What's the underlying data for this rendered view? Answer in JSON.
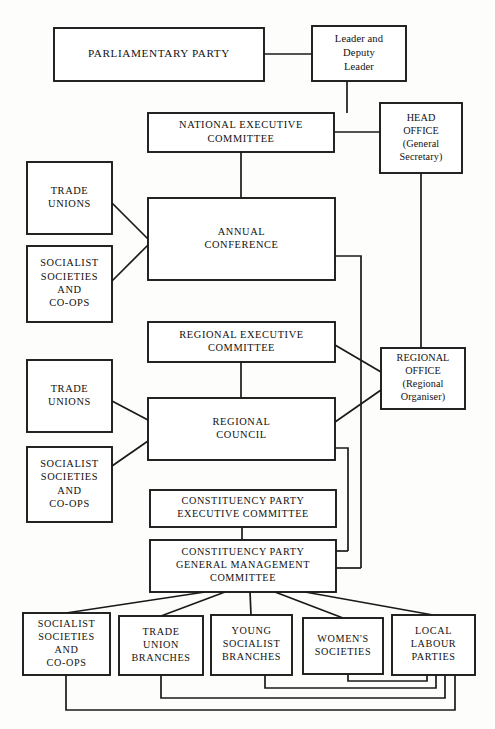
{
  "chart_data": {
    "type": "diagram",
    "orientation": "top-down",
    "nodes": [
      {
        "id": "parliamentary-party",
        "lines": [
          "PARLIAMENTARY PARTY"
        ],
        "style": "caps",
        "x": 54,
        "y": 28,
        "w": 210,
        "h": 53,
        "font": 11.2
      },
      {
        "id": "leader-deputy-leader",
        "lines": [
          "Leader and",
          "Deputy",
          "Leader"
        ],
        "style": "mixed",
        "x": 312,
        "y": 26,
        "w": 94,
        "h": 55,
        "font": 10.6
      },
      {
        "id": "national-executive-committee",
        "lines": [
          "NATIONAL  EXECUTIVE",
          "COMMITTEE"
        ],
        "style": "caps",
        "x": 148,
        "y": 113,
        "w": 186,
        "h": 39,
        "font": 10.4
      },
      {
        "id": "head-office",
        "lines": [
          "HEAD",
          "OFFICE",
          "(General",
          "Secretary)"
        ],
        "style": "mixed",
        "x": 380,
        "y": 103,
        "w": 82,
        "h": 70,
        "font": 10.2
      },
      {
        "id": "trade-unions-national",
        "lines": [
          "TRADE",
          "UNIONS"
        ],
        "style": "caps",
        "x": 27,
        "y": 162,
        "w": 85,
        "h": 72,
        "font": 10.4
      },
      {
        "id": "socialist-societies-national",
        "lines": [
          "SOCIALIST",
          "SOCIETIES",
          "AND",
          "CO-OPS"
        ],
        "style": "caps",
        "x": 27,
        "y": 246,
        "w": 85,
        "h": 76,
        "font": 10.4
      },
      {
        "id": "annual-conference",
        "lines": [
          "ANNUAL",
          "CONFERENCE"
        ],
        "style": "caps",
        "x": 148,
        "y": 198,
        "w": 187,
        "h": 82,
        "font": 10.4
      },
      {
        "id": "regional-executive-committee",
        "lines": [
          "REGIONAL  EXECUTIVE",
          "COMMITTEE"
        ],
        "style": "caps",
        "x": 148,
        "y": 322,
        "w": 187,
        "h": 40,
        "font": 10.4
      },
      {
        "id": "regional-office",
        "lines": [
          "REGIONAL",
          "OFFICE",
          "(Regional",
          "Organiser)"
        ],
        "style": "mixed",
        "x": 381,
        "y": 348,
        "w": 84,
        "h": 61,
        "font": 10.2
      },
      {
        "id": "trade-unions-regional",
        "lines": [
          "TRADE",
          "UNIONS"
        ],
        "style": "caps",
        "x": 27,
        "y": 360,
        "w": 85,
        "h": 72,
        "font": 10.4
      },
      {
        "id": "socialist-societies-regional",
        "lines": [
          "SOCIALIST",
          "SOCIETIES",
          "AND",
          "CO-OPS"
        ],
        "style": "caps",
        "x": 27,
        "y": 447,
        "w": 85,
        "h": 75,
        "font": 10.4
      },
      {
        "id": "regional-council",
        "lines": [
          "REGIONAL",
          "COUNCIL"
        ],
        "style": "caps",
        "x": 148,
        "y": 398,
        "w": 187,
        "h": 62,
        "font": 10.4
      },
      {
        "id": "constituency-party-executive-committee",
        "lines": [
          "CONSTITUENCY  PARTY",
          "EXECUTIVE  COMMITTEE"
        ],
        "style": "caps",
        "x": 150,
        "y": 490,
        "w": 186,
        "h": 37,
        "font": 10.2
      },
      {
        "id": "constituency-party-general-management-committee",
        "lines": [
          "CONSTITUENCY  PARTY",
          "GENERAL  MANAGEMENT",
          "COMMITTEE"
        ],
        "style": "caps",
        "x": 150,
        "y": 540,
        "w": 186,
        "h": 52,
        "font": 10.2
      },
      {
        "id": "socialist-societies-local",
        "lines": [
          "SOCIALIST",
          "SOCIETIES",
          "AND",
          "CO-OPS"
        ],
        "style": "caps",
        "x": 23,
        "y": 613,
        "w": 87,
        "h": 62,
        "font": 10.2
      },
      {
        "id": "trade-union-branches",
        "lines": [
          "TRADE",
          "UNION",
          "BRANCHES"
        ],
        "style": "caps",
        "x": 119,
        "y": 616,
        "w": 84,
        "h": 59,
        "font": 10.2
      },
      {
        "id": "young-socialist-branches",
        "lines": [
          "YOUNG",
          "SOCIALIST",
          "BRANCHES"
        ],
        "style": "caps",
        "x": 211,
        "y": 615,
        "w": 81,
        "h": 60,
        "font": 10.2
      },
      {
        "id": "womens-societies",
        "lines": [
          "WOMEN'S",
          "SOCIETIES"
        ],
        "style": "caps",
        "x": 303,
        "y": 618,
        "w": 80,
        "h": 56,
        "font": 10.2
      },
      {
        "id": "local-labour-parties",
        "lines": [
          "LOCAL",
          "LABOUR",
          "PARTIES"
        ],
        "style": "caps",
        "x": 392,
        "y": 615,
        "w": 83,
        "h": 60,
        "font": 10.2
      }
    ],
    "edges": [
      {
        "id": "parliamentary-to-leader",
        "points": "264,54 312,54"
      },
      {
        "id": "leader-to-nec",
        "points": "347,81 347,113"
      },
      {
        "id": "nec-to-head-office",
        "points": "334,132 380,132"
      },
      {
        "id": "nec-to-annual-conference",
        "points": "241,152 241,198"
      },
      {
        "id": "trade-unions-to-annual-conference",
        "points": "112,203 148,239"
      },
      {
        "id": "socialist-societies-to-annual-conference",
        "points": "112,281 148,245"
      },
      {
        "id": "head-office-to-regional-office",
        "points": "421,173 421,348"
      },
      {
        "id": "annual-conference-to-spine",
        "points": "335,256 361,256 361,568"
      },
      {
        "id": "spine-to-gmc",
        "points": "361,568 336,568"
      },
      {
        "id": "rec-to-regional-office",
        "points": "335,345 381,372"
      },
      {
        "id": "rec-to-regional-council",
        "points": "241,362 241,398"
      },
      {
        "id": "trade-unions-reg-to-council",
        "points": "112,401 148,420"
      },
      {
        "id": "socialist-societies-reg-to-council",
        "points": "112,466 148,441"
      },
      {
        "id": "regional-council-to-regional-office",
        "points": "335,422 381,390"
      },
      {
        "id": "regional-council-to-spine2",
        "points": "335,448 348,448 348,551"
      },
      {
        "id": "spine2-to-gmc",
        "points": "348,551 336,551"
      },
      {
        "id": "cpec-to-gmc",
        "points": "242,527 242,540"
      },
      {
        "id": "gmc-to-socialist-local",
        "points": "205,592 66,613"
      },
      {
        "id": "gmc-to-trade-union-branches",
        "points": "225,592 161,616"
      },
      {
        "id": "gmc-to-young-socialist",
        "points": "250,592 251,615"
      },
      {
        "id": "gmc-to-womens-societies",
        "points": "275,592 343,618"
      },
      {
        "id": "gmc-to-local-labour",
        "points": "305,592 433,615"
      },
      {
        "id": "socialist-local-return",
        "points": "66,675 66,710 455,710 455,675"
      },
      {
        "id": "trade-union-branches-return",
        "points": "161,675 161,698 445,698 445,675"
      },
      {
        "id": "young-socialist-return",
        "points": "265,675 265,688 436,688 436,675"
      },
      {
        "id": "womens-societies-return",
        "points": "348,674 348,681 427,681 427,675"
      }
    ]
  }
}
